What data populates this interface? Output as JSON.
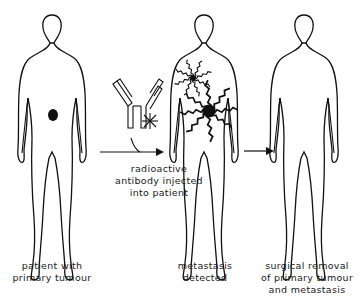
{
  "diagram": {
    "panels": [
      {
        "id": "patient",
        "label_lines": [
          "patient with",
          "primary tumour"
        ]
      },
      {
        "id": "metastasis",
        "label_lines": [
          "metastasis",
          "detected"
        ]
      },
      {
        "id": "surgery",
        "label_lines": [
          "surgical removal",
          "of primary tumour",
          "and metastasis"
        ]
      }
    ],
    "step1": {
      "label_lines": [
        "radioactive",
        "antibody injected",
        "into patient"
      ]
    },
    "icons": {
      "antibody": "y-shaped-antibody-icon",
      "radioactive_label": "asterisk-star-icon",
      "arrow": "right-arrow-icon"
    },
    "colors": {
      "ink": "#111111",
      "background": "#ffffff"
    }
  }
}
